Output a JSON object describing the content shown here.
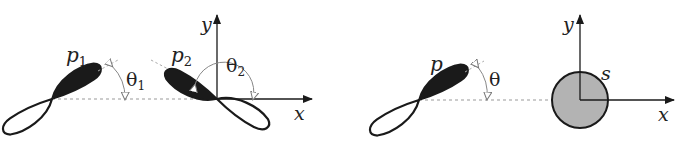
{
  "colors": {
    "ink": "#1a1a1a",
    "lobe_fill": "#1a1a1a",
    "s_fill": "#b3b3b3",
    "dashed": "#999999",
    "arc": "#888888"
  },
  "panels": [
    {
      "name": "two-p-orbitals",
      "axes": {
        "x_label": "x",
        "y_label": "y"
      },
      "orbitals": [
        {
          "label": "p",
          "subscript": "1",
          "angle_label": "θ",
          "angle_subscript": "1"
        },
        {
          "label": "p",
          "subscript": "2",
          "angle_label": "θ",
          "angle_subscript": "2"
        }
      ]
    },
    {
      "name": "p-and-s-orbitals",
      "axes": {
        "x_label": "x",
        "y_label": "y"
      },
      "p_orbital": {
        "label": "p",
        "angle_label": "θ"
      },
      "s_orbital": {
        "label": "s"
      }
    }
  ]
}
